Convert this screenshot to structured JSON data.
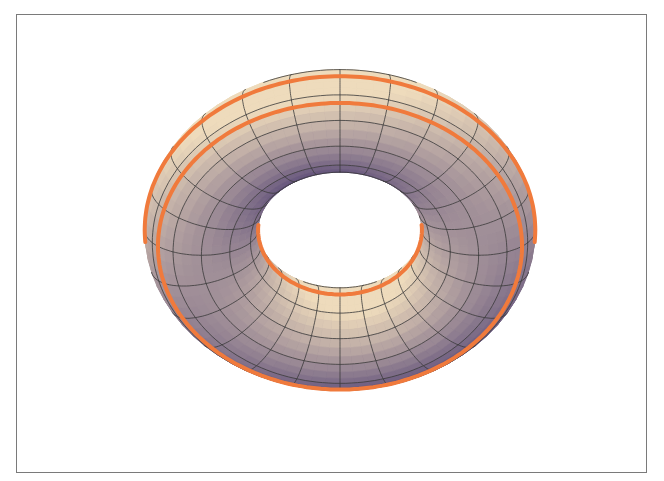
{
  "figure": {
    "colors": {
      "frame": "#7a7a7a",
      "background": "#ffffff",
      "surface_light": "#e9d8bc",
      "surface_mid": "#cdb9a4",
      "surface_shadow": "#6e5f86",
      "mesh": "#3a3a3a",
      "highlight": "#f07a3c"
    },
    "torus": {
      "cx": 340,
      "cy": 212,
      "R": 132,
      "r": 54,
      "tilt": 0.42,
      "thickness_scale": 1.0
    },
    "mesh": {
      "meridians": 24,
      "parallels": 12
    },
    "highlight_circles": [
      {
        "name": "outer-equator",
        "v_deg": 0
      },
      {
        "name": "top-outer",
        "v_deg": 60
      },
      {
        "name": "top-inner",
        "v_deg": 120
      },
      {
        "name": "inner-equator",
        "v_deg": 180
      },
      {
        "name": "bottom-outer",
        "v_deg": -40
      }
    ]
  }
}
